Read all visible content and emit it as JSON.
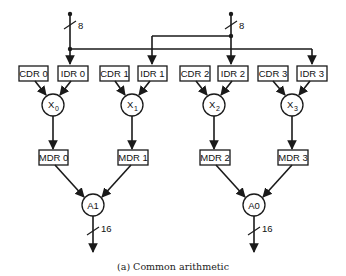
{
  "diagram": {
    "caption": "(a) Common arithmetic",
    "buses": [
      {
        "id": "bus-left",
        "width_label": "8"
      },
      {
        "id": "bus-right",
        "width_label": "8"
      }
    ],
    "input_registers": [
      {
        "label": "CDR 0"
      },
      {
        "label": "IDR 0"
      },
      {
        "label": "CDR 1"
      },
      {
        "label": "IDR 1"
      },
      {
        "label": "CDR 2"
      },
      {
        "label": "IDR 2"
      },
      {
        "label": "CDR 3"
      },
      {
        "label": "IDR 3"
      }
    ],
    "multipliers": [
      {
        "label": "X",
        "sub": "0"
      },
      {
        "label": "X",
        "sub": "1"
      },
      {
        "label": "X",
        "sub": "2"
      },
      {
        "label": "X",
        "sub": "3"
      }
    ],
    "mdr_registers": [
      {
        "label": "MDR 0"
      },
      {
        "label": "MDR 1"
      },
      {
        "label": "MDR 2"
      },
      {
        "label": "MDR 3"
      }
    ],
    "adders": [
      {
        "label": "A1",
        "output_width": "16"
      },
      {
        "label": "A0",
        "output_width": "16"
      }
    ]
  }
}
